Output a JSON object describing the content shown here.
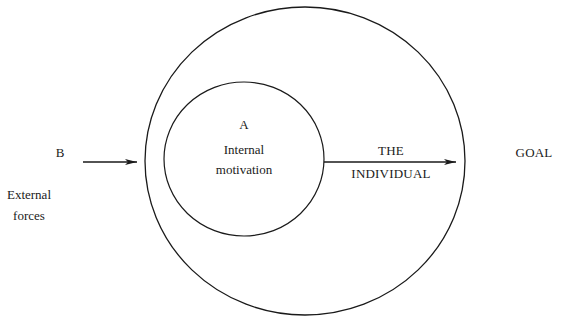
{
  "diagram": {
    "type": "concentric-circle motivation diagram",
    "outer_circle": {
      "label_line1": "THE",
      "label_line2": "INDIVIDUAL"
    },
    "inner_circle": {
      "letter": "A",
      "label_line1": "Internal",
      "label_line2": "motivation"
    },
    "external": {
      "letter": "B",
      "label_line1": "External",
      "label_line2": "forces"
    },
    "goal": {
      "label": "GOAL"
    },
    "colors": {
      "stroke": "#1a1a1a",
      "background": "#ffffff"
    }
  }
}
